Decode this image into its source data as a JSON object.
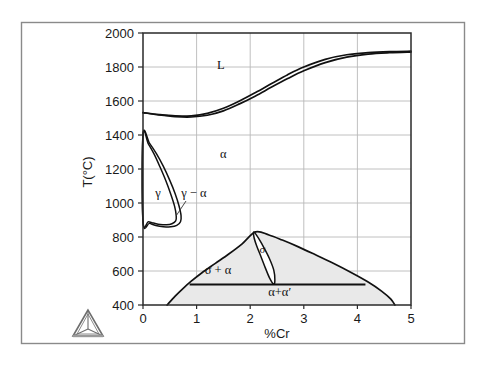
{
  "figure": {
    "frame_color": "#7a7a7a",
    "background": "#ffffff",
    "logo_name": "triangular-tetrahedron-logo"
  },
  "chart_data": {
    "type": "line",
    "title": "",
    "subtitle": "",
    "xlabel": "%Cr",
    "ylabel": "T(°C)",
    "xlim": [
      0,
      5
    ],
    "ylim": [
      400,
      2000
    ],
    "grid": true,
    "legend_position": "none",
    "xticks": [
      "0",
      "1",
      "2",
      "3",
      "4",
      "5"
    ],
    "xtick_values": [
      0,
      1,
      2,
      3,
      4,
      5
    ],
    "yticks": [
      "400",
      "600",
      "800",
      "1000",
      "1200",
      "1400",
      "1600",
      "1800",
      "2000"
    ],
    "ytick_values": [
      400,
      600,
      800,
      1000,
      1200,
      1400,
      1600,
      1800,
      2000
    ],
    "line_color": "#111111",
    "shaded_region_fill": "#e9e9e9",
    "shaded_region_stroke": "#111111",
    "annotations": [
      {
        "text": "L",
        "x": 1.45,
        "y": 1790,
        "name": "liquid-phase-label"
      },
      {
        "text": "α",
        "x": 1.5,
        "y": 1265,
        "name": "alpha-phase-label"
      },
      {
        "text": "γ",
        "x": 0.28,
        "y": 1035,
        "name": "gamma-phase-label"
      },
      {
        "text": "γ − α",
        "x": 0.95,
        "y": 1035,
        "name": "gamma-alpha-phase-label"
      },
      {
        "text": "σ",
        "x": 2.23,
        "y": 705,
        "name": "sigma-phase-label"
      },
      {
        "text": "σ + α",
        "x": 1.4,
        "y": 580,
        "name": "sigma-plus-alpha-label"
      },
      {
        "text": "α+α′",
        "x": 2.55,
        "y": 455,
        "name": "alpha-plus-alpha-prime-label"
      }
    ],
    "series": [
      {
        "name": "liquidus",
        "comment": "upper boundary of L+α two-phase band",
        "points": [
          [
            0.0,
            1532
          ],
          [
            0.3,
            1520
          ],
          [
            0.6,
            1512
          ],
          [
            0.9,
            1513
          ],
          [
            1.2,
            1527
          ],
          [
            1.5,
            1557
          ],
          [
            1.8,
            1600
          ],
          [
            2.1,
            1650
          ],
          [
            2.4,
            1703
          ],
          [
            2.7,
            1755
          ],
          [
            3.0,
            1800
          ],
          [
            3.4,
            1845
          ],
          [
            3.8,
            1872
          ],
          [
            4.2,
            1884
          ],
          [
            4.6,
            1890
          ],
          [
            5.0,
            1893
          ]
        ]
      },
      {
        "name": "solidus",
        "comment": "lower boundary of L+α two-phase band",
        "points": [
          [
            0.0,
            1532
          ],
          [
            0.3,
            1518
          ],
          [
            0.6,
            1508
          ],
          [
            0.9,
            1506
          ],
          [
            1.2,
            1516
          ],
          [
            1.5,
            1542
          ],
          [
            1.8,
            1583
          ],
          [
            2.1,
            1630
          ],
          [
            2.4,
            1682
          ],
          [
            2.7,
            1732
          ],
          [
            3.0,
            1778
          ],
          [
            3.4,
            1826
          ],
          [
            3.8,
            1858
          ],
          [
            4.2,
            1876
          ],
          [
            4.6,
            1884
          ],
          [
            5.0,
            1888
          ]
        ]
      },
      {
        "name": "gamma-loop-outer",
        "comment": "closed austenite (gamma) loop, outer boundary",
        "closed": true,
        "points": [
          [
            0.0,
            1400
          ],
          [
            0.12,
            1352
          ],
          [
            0.25,
            1290
          ],
          [
            0.38,
            1215
          ],
          [
            0.5,
            1133
          ],
          [
            0.6,
            1055
          ],
          [
            0.67,
            985
          ],
          [
            0.71,
            925
          ],
          [
            0.7,
            890
          ],
          [
            0.63,
            868
          ],
          [
            0.52,
            860
          ],
          [
            0.38,
            861
          ],
          [
            0.24,
            868
          ],
          [
            0.12,
            880
          ],
          [
            0.0,
            890
          ]
        ]
      },
      {
        "name": "gamma-loop-inner",
        "comment": "closed austenite (gamma) loop, inner boundary",
        "closed": true,
        "points": [
          [
            0.0,
            1400
          ],
          [
            0.1,
            1348
          ],
          [
            0.21,
            1286
          ],
          [
            0.32,
            1210
          ],
          [
            0.43,
            1128
          ],
          [
            0.52,
            1050
          ],
          [
            0.59,
            980
          ],
          [
            0.62,
            925
          ],
          [
            0.61,
            895
          ],
          [
            0.54,
            878
          ],
          [
            0.44,
            872
          ],
          [
            0.32,
            874
          ],
          [
            0.2,
            882
          ],
          [
            0.1,
            890
          ],
          [
            0.0,
            895
          ]
        ]
      },
      {
        "name": "miscibility-dome",
        "comment": "alpha + alpha-prime miscibility gap dome, shaded",
        "points": [
          [
            0.45,
            400
          ],
          [
            0.6,
            452
          ],
          [
            0.75,
            498
          ],
          [
            0.9,
            540
          ],
          [
            1.1,
            590
          ],
          [
            1.35,
            645
          ],
          [
            1.6,
            700
          ],
          [
            1.85,
            760
          ],
          [
            2.1,
            830
          ],
          [
            2.35,
            812
          ],
          [
            2.6,
            782
          ],
          [
            2.9,
            742
          ],
          [
            3.2,
            698
          ],
          [
            3.55,
            645
          ],
          [
            3.9,
            588
          ],
          [
            4.2,
            535
          ],
          [
            4.45,
            482
          ],
          [
            4.62,
            436
          ],
          [
            4.7,
            400
          ]
        ]
      },
      {
        "name": "sigma-alpha-horizontal",
        "comment": "horizontal boundary separating sigma+alpha from alpha+alpha-prime",
        "temperature": 520,
        "points": [
          [
            0.87,
            520
          ],
          [
            4.15,
            520
          ]
        ]
      },
      {
        "name": "sigma-lens",
        "comment": "narrow sigma single-phase lens",
        "closed": true,
        "points": [
          [
            2.07,
            830
          ],
          [
            2.16,
            790
          ],
          [
            2.26,
            735
          ],
          [
            2.36,
            672
          ],
          [
            2.44,
            605
          ],
          [
            2.46,
            548
          ],
          [
            2.44,
            522
          ],
          [
            2.36,
            560
          ],
          [
            2.28,
            620
          ],
          [
            2.2,
            685
          ],
          [
            2.12,
            748
          ],
          [
            2.07,
            800
          ]
        ]
      }
    ]
  }
}
